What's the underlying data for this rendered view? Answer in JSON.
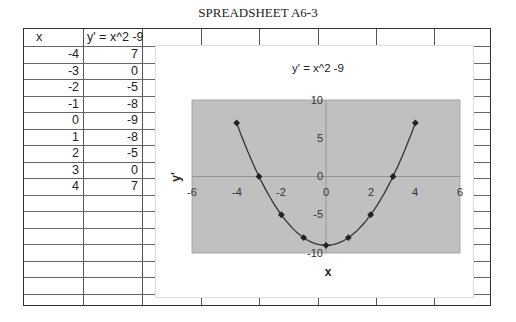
{
  "page_title": "SPREADSHEET A6-3",
  "table": {
    "headers": [
      "x",
      "y' = x^2 -9"
    ],
    "rows": [
      {
        "x": "-4",
        "y": "7"
      },
      {
        "x": "-3",
        "y": "0"
      },
      {
        "x": "-2",
        "y": "-5"
      },
      {
        "x": "-1",
        "y": "-8"
      },
      {
        "x": "0",
        "y": "-9"
      },
      {
        "x": "1",
        "y": "-8"
      },
      {
        "x": "2",
        "y": "-5"
      },
      {
        "x": "3",
        "y": "0"
      },
      {
        "x": "4",
        "y": "7"
      }
    ]
  },
  "chart": {
    "title": "y' = x^2 -9",
    "xlabel": "x",
    "ylabel": "y'",
    "x_ticks": [
      "-6",
      "-4",
      "-2",
      "0",
      "2",
      "4",
      "6"
    ],
    "y_ticks": [
      "10",
      "5",
      "0",
      "-5",
      "-10"
    ],
    "plot_bg": "#c0c0c0",
    "line_color": "#333333"
  },
  "chart_data": {
    "type": "scatter",
    "title": "y' = x^2 -9",
    "xlabel": "x",
    "ylabel": "y'",
    "x": [
      -4,
      -3,
      -2,
      -1,
      0,
      1,
      2,
      3,
      4
    ],
    "series": [
      {
        "name": "y' = x^2 -9",
        "values": [
          7,
          0,
          -5,
          -8,
          -9,
          -8,
          -5,
          0,
          7
        ]
      }
    ],
    "xlim": [
      -6,
      6
    ],
    "ylim": [
      -10,
      10
    ],
    "smoothed_line": true,
    "markers": "diamond",
    "grid": false,
    "legend": "none"
  }
}
